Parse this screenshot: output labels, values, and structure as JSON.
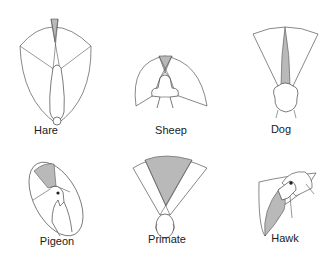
{
  "figure": {
    "title": "",
    "colors": {
      "monocular": "#ffffff",
      "binocular": "#b9b9b9",
      "outline": "#555555"
    }
  },
  "panels": [
    {
      "id": "hare",
      "label": "Hare"
    },
    {
      "id": "sheep",
      "label": "Sheep"
    },
    {
      "id": "dog",
      "label": "Dog"
    },
    {
      "id": "pigeon",
      "label": "Pigeon"
    },
    {
      "id": "primate",
      "label": "Primate"
    },
    {
      "id": "hawk",
      "label": "Hawk"
    }
  ]
}
